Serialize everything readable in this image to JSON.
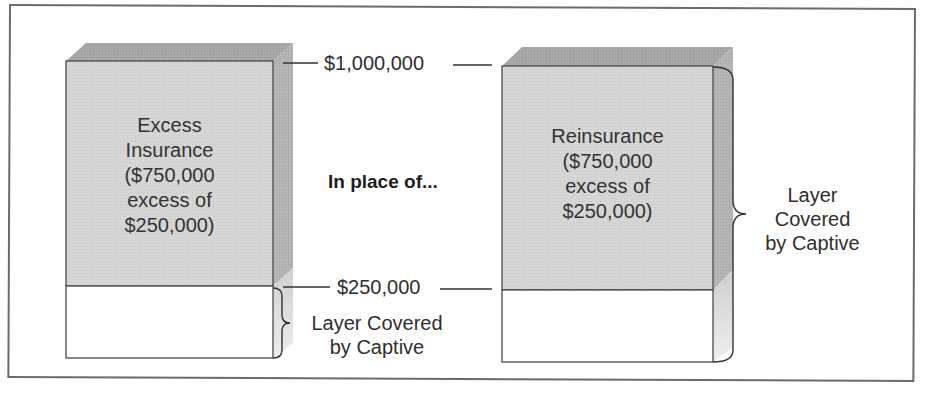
{
  "diagram": {
    "title_fragment": "...g ...p...",
    "left_block": {
      "upper_label_lines": [
        "Excess",
        "Insurance",
        "($750,000",
        "excess of",
        "$250,000)"
      ],
      "lower_label": "Layer Covered by Captive",
      "lower_label_lines": [
        "Layer Covered",
        "by Captive"
      ]
    },
    "connector": "In place of...",
    "right_block": {
      "upper_label_lines": [
        "Reinsurance",
        "($750,000",
        "excess of",
        "$250,000)"
      ],
      "side_label_lines": [
        "Layer",
        "Covered",
        "by Captive"
      ]
    },
    "levels": {
      "top": "$1,000,000",
      "bottom": "$250,000"
    },
    "colors": {
      "shaded_face": "#d9d9d9",
      "top_face": "#a9a9a9",
      "side_face": "#b8b8b8",
      "side_face_light": "#dcdcdc",
      "outline": "#4a4a4a",
      "frame": "#6b6b6b"
    }
  }
}
